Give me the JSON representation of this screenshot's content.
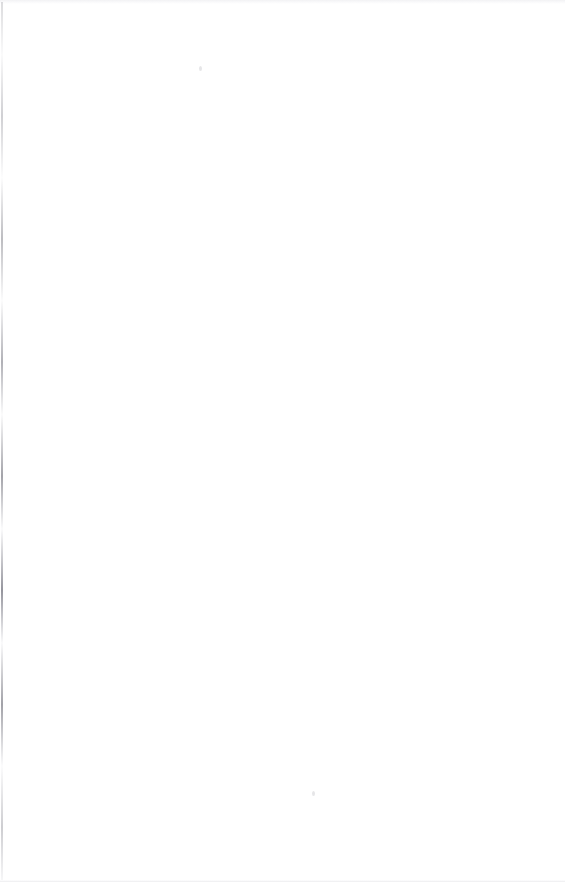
{
  "document": {
    "kind": "scanned-page-image",
    "page_content": "blank",
    "visible_text": "",
    "page_number_shown": "",
    "width_px": 565,
    "height_px": 882
  },
  "canvas": {
    "paper_color": "#ffffff",
    "gutter_color": "#050505",
    "edge_line_color": "#8c8c94",
    "top_band_color": "#f2f2f4",
    "bottom_line_color": "#ececed"
  },
  "regions": {
    "paper_surface_label": "",
    "gutter_void_label": "",
    "top_edge_band_label": "",
    "bottom_edge_line_label": "",
    "left_edge_line_label": "",
    "speck_one_label": "",
    "speck_two_label": ""
  },
  "gutter_void": {
    "description": "black scanner void along right edge with irregular jagged inner boundary",
    "x_start_min_px": 546,
    "x_start_max_px": 557,
    "notch_regions_y_px": [
      [
        58,
        78
      ],
      [
        283,
        307
      ]
    ]
  }
}
